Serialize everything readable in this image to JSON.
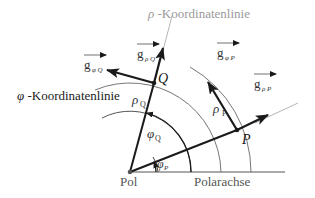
{
  "colors": {
    "main": "#1a1a1a",
    "gray_label": "#9a9a9a",
    "gray_line": "#b5b5b5",
    "arc": "#555555",
    "text": "#333333"
  },
  "labels": {
    "rho_line": {
      "sym": "ρ",
      "text": " -Koordinatenlinie"
    },
    "phi_line": {
      "sym": "φ",
      "text": " -Koordinatenlinie"
    },
    "pol": "Pol",
    "polarachse": "Polarachse",
    "point_Q": "Q",
    "point_P": "P",
    "g_rho_Q": {
      "base": "g",
      "sub": "ρ Q"
    },
    "g_phi_Q": {
      "base": "g",
      "sub": "φ Q"
    },
    "g_phi_P": {
      "base": "g",
      "sub": "φ P"
    },
    "g_rho_P": {
      "base": "g",
      "sub": "ρ P"
    },
    "rho_Q": {
      "base": "ρ",
      "sub": "Q"
    },
    "rho_P": {
      "base": "ρ",
      "sub": "P"
    },
    "phi_Q": {
      "base": "φ",
      "sub": "Q"
    },
    "phi_P": {
      "base": "φ",
      "sub": "P"
    }
  }
}
